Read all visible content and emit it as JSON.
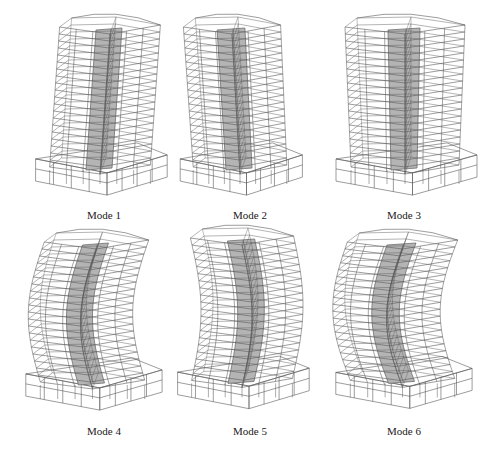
{
  "figure": {
    "panels": [
      {
        "label": "Mode 1",
        "caption_x": 104,
        "caption_y": 209,
        "box": {
          "x": 30,
          "y": 22,
          "w": 140,
          "h": 185
        },
        "sway": 10,
        "curve": 0,
        "twist": 0
      },
      {
        "label": "Mode 2",
        "caption_x": 250,
        "caption_y": 209,
        "box": {
          "x": 175,
          "y": 22,
          "w": 130,
          "h": 185
        },
        "sway": -8,
        "curve": 0,
        "twist": 0.3
      },
      {
        "label": "Mode 3",
        "caption_x": 404,
        "caption_y": 209,
        "box": {
          "x": 330,
          "y": 22,
          "w": 150,
          "h": 185
        },
        "sway": 0,
        "curve": 0,
        "twist": 1
      },
      {
        "label": "Mode 4",
        "caption_x": 104,
        "caption_y": 425,
        "box": {
          "x": 20,
          "y": 237,
          "w": 145,
          "h": 185
        },
        "sway": 4,
        "curve": -14,
        "twist": 0
      },
      {
        "label": "Mode 5",
        "caption_x": 250,
        "caption_y": 425,
        "box": {
          "x": 172,
          "y": 233,
          "w": 140,
          "h": 188
        },
        "sway": 0,
        "curve": 10,
        "twist": 0.2
      },
      {
        "label": "Mode 6",
        "caption_x": 404,
        "caption_y": 425,
        "box": {
          "x": 330,
          "y": 237,
          "w": 145,
          "h": 183
        },
        "sway": 0,
        "curve": -16,
        "twist": 0.5
      }
    ],
    "style": {
      "line_color": "#5a5a5a",
      "core_color": "#b4b4b4",
      "core_edge": "#6e6e6e",
      "background": "#ffffff"
    },
    "floors": 20
  }
}
